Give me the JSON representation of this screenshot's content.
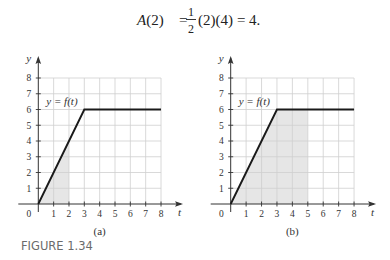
{
  "equation": {
    "lhs": "A(2)",
    "equals": "=",
    "frac_num": "1",
    "frac_den": "2",
    "rest": "(2)(4)",
    "equals2": "=",
    "result": "4."
  },
  "figure_caption": "FIGURE 1.34",
  "chart_data": [
    {
      "type": "line",
      "panel": "(a)",
      "title": "",
      "function_label": "y = f(t)",
      "xlabel": "t",
      "ylabel": "y",
      "origin_label": "0",
      "xlim": [
        0,
        8
      ],
      "ylim": [
        0,
        8
      ],
      "grid": true,
      "x_ticks": [
        "1",
        "2",
        "3",
        "4",
        "5",
        "6",
        "7",
        "8"
      ],
      "y_ticks": [
        "1",
        "2",
        "3",
        "4",
        "5",
        "6",
        "7",
        "8"
      ],
      "series": [
        {
          "name": "f(t)",
          "x": [
            0,
            3,
            8
          ],
          "y": [
            0,
            6,
            6
          ]
        }
      ],
      "shaded_region": {
        "from_t": 0,
        "to_t": 2,
        "area": 4
      }
    },
    {
      "type": "line",
      "panel": "(b)",
      "title": "",
      "function_label": "y = f(t)",
      "xlabel": "t",
      "ylabel": "y",
      "origin_label": "0",
      "xlim": [
        0,
        8
      ],
      "ylim": [
        0,
        8
      ],
      "grid": true,
      "x_ticks": [
        "1",
        "2",
        "3",
        "4",
        "5",
        "6",
        "7",
        "8"
      ],
      "y_ticks": [
        "1",
        "2",
        "3",
        "4",
        "5",
        "6",
        "7",
        "8"
      ],
      "series": [
        {
          "name": "f(t)",
          "x": [
            0,
            3,
            8
          ],
          "y": [
            0,
            6,
            6
          ]
        }
      ],
      "shaded_region": {
        "from_t": 0,
        "to_t": 5
      }
    }
  ],
  "colors": {
    "line": "#1a1a1a",
    "grid": "#cfcfcf",
    "shade": "#e6e6e6",
    "axis": "#333333",
    "caption": "#6b6b6b"
  }
}
